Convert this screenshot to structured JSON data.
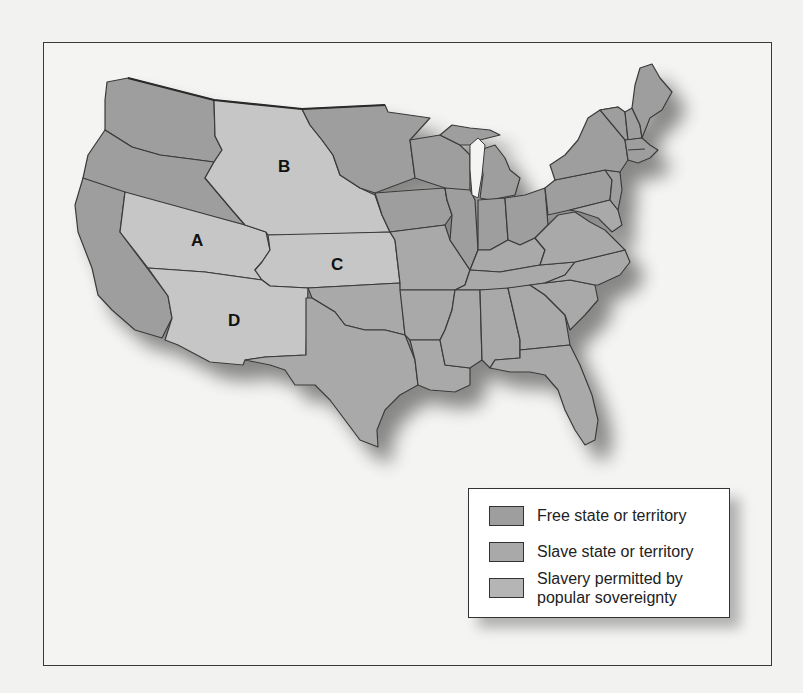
{
  "map": {
    "region_labels": [
      {
        "id": "A",
        "label": "A"
      },
      {
        "id": "B",
        "label": "B"
      },
      {
        "id": "C",
        "label": "C"
      },
      {
        "id": "D",
        "label": "D"
      }
    ],
    "colors": {
      "free": "#9e9e9e",
      "slave": "#a9a9a9",
      "popular_sovereignty": "#c6c6c6",
      "border": "#3a3a3a",
      "background": "#f4f4f2"
    }
  },
  "legend": {
    "items": [
      {
        "key": "free",
        "label": "Free state or territory",
        "color": "#9e9e9e"
      },
      {
        "key": "slave",
        "label": "Slave state or territory",
        "color": "#a9a9a9"
      },
      {
        "key": "popular_sovereignty",
        "label_line1": "Slavery permitted by",
        "label_line2": "popular sovereignty",
        "color": "#b5b5b5"
      }
    ]
  }
}
